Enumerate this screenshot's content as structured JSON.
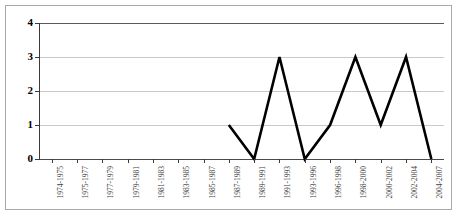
{
  "chart_data": {
    "type": "line",
    "title": "",
    "xlabel": "",
    "ylabel": "",
    "categories": [
      "1974-1975",
      "1975-1977",
      "1977-1979",
      "1979-1981",
      "1981-1983",
      "1983-1985",
      "1985-1987",
      "1987-1989",
      "1989-1991",
      "1991-1993",
      "1993-1996",
      "1996-1998",
      "1998-2000",
      "2000-2002",
      "2002-2004",
      "2004-2007"
    ],
    "values": [
      null,
      null,
      null,
      null,
      null,
      null,
      null,
      1,
      0,
      3,
      0,
      1,
      3,
      1,
      3,
      0
    ],
    "ylim": [
      0,
      4
    ],
    "ytick_labels": [
      "0",
      "1",
      "2",
      "3",
      "4"
    ],
    "yticks": [
      0,
      1,
      2,
      3,
      4
    ],
    "grid": true,
    "legend": false,
    "series_color": "#000000",
    "gridline_color": "#c9c9c9",
    "axis_color": "#3a3a3a",
    "border_color": "#a8a8a8",
    "background_color": "#ffffff",
    "xlabel_rotation": -90
  }
}
